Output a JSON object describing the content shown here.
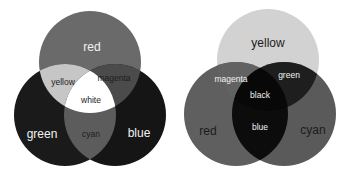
{
  "diagrams": [
    {
      "name": "additive-rgb",
      "circles": {
        "red": {
          "label": "red",
          "cx": 90,
          "cy": 62,
          "r": 51,
          "fill": "#6a6a6a"
        },
        "green": {
          "label": "green",
          "cx": 65,
          "cy": 115,
          "r": 51,
          "fill": "#1a1a1a"
        },
        "blue": {
          "label": "blue",
          "cx": 115,
          "cy": 115,
          "r": 51,
          "fill": "#151515"
        }
      },
      "overlaps": {
        "yellow": {
          "label": "yellow",
          "fill": "#c6c6c6"
        },
        "magenta": {
          "label": "magenta",
          "fill": "#4b4b4b"
        },
        "cyan": {
          "label": "cyan",
          "fill": "#5c5c5c"
        },
        "white": {
          "label": "white",
          "fill": "#ffffff"
        }
      }
    },
    {
      "name": "subtractive-cmy",
      "circles": {
        "yellow": {
          "label": "yellow",
          "cx": 268,
          "cy": 60,
          "r": 51,
          "fill": "#d2d2d2"
        },
        "red": {
          "label": "red",
          "cx": 236,
          "cy": 114,
          "r": 52,
          "fill": "#5f5f5f"
        },
        "cyan": {
          "label": "cyan",
          "cx": 284,
          "cy": 114,
          "r": 52,
          "fill": "#5a5a5a"
        }
      },
      "overlaps": {
        "magenta": {
          "label": "magenta",
          "fill": "#626262"
        },
        "green": {
          "label": "green",
          "fill": "#1e1e1e"
        },
        "blue": {
          "label": "blue",
          "fill": "#0c0c0c"
        },
        "black": {
          "label": "black",
          "fill": "#080808"
        }
      }
    }
  ]
}
